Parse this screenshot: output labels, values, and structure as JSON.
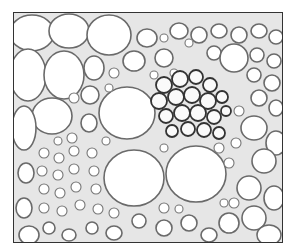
{
  "image": {
    "description": "Light micrograph cross-section of a plant vascular bundle: large thin-walled parenchyma cells, two large xylem vessels, a cluster of smaller polygonal phloem cells, surrounded by small cells",
    "style": "grayscale",
    "frame_color": "#333333",
    "wall_color": "#555555",
    "lumen_color": "#ffffff"
  }
}
